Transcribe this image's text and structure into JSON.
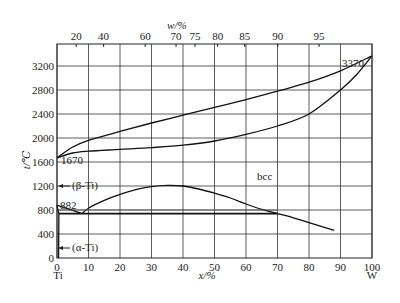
{
  "chart_data": {
    "type": "line",
    "xlabel": "x/%",
    "x2label": "w/%",
    "ylabel": "t/℃",
    "xlim": [
      0,
      100
    ],
    "ylim": [
      0,
      3600
    ],
    "x_ticks": [
      0,
      10,
      20,
      30,
      40,
      50,
      60,
      70,
      80,
      90,
      100
    ],
    "y_ticks": [
      0,
      400,
      800,
      1200,
      1600,
      2000,
      2400,
      2800,
      3200
    ],
    "top_ticks": [
      {
        "label": "20",
        "x": 6.1
      },
      {
        "label": "40",
        "x": 14.8
      },
      {
        "label": "60",
        "x": 28.0
      },
      {
        "label": "70",
        "x": 37.8
      },
      {
        "label": "75",
        "x": 43.8
      },
      {
        "label": "80",
        "x": 51.0
      },
      {
        "label": "85",
        "x": 59.6
      },
      {
        "label": "90",
        "x": 70.1
      },
      {
        "label": "95",
        "x": 83.2
      }
    ],
    "grid": true,
    "endpoint_labels": {
      "left": "Ti",
      "right": "W"
    },
    "annotations": [
      {
        "text": "3370",
        "x": 100,
        "y": 3370
      },
      {
        "text": "1670",
        "x": 0,
        "y": 1670
      },
      {
        "text": "882",
        "x": 0,
        "y": 882
      },
      {
        "text": "(β-Ti)",
        "x": 0,
        "y": 1250
      },
      {
        "text": "(α-Ti)",
        "x": 0,
        "y": 200
      },
      {
        "text": "bcc",
        "x": 58,
        "y": 1450
      }
    ],
    "series": [
      {
        "name": "liquidus",
        "x": [
          0,
          5,
          10,
          20,
          30,
          40,
          50,
          60,
          70,
          80,
          90,
          100
        ],
        "y": [
          1670,
          1850,
          1960,
          2110,
          2250,
          2380,
          2510,
          2640,
          2780,
          2930,
          3120,
          3370
        ]
      },
      {
        "name": "solidus",
        "x": [
          0,
          5,
          10,
          20,
          30,
          40,
          50,
          60,
          70,
          80,
          90,
          95,
          100
        ],
        "y": [
          1670,
          1750,
          1780,
          1810,
          1840,
          1880,
          1950,
          2060,
          2200,
          2400,
          2800,
          3050,
          3370
        ]
      },
      {
        "name": "miscibility gap",
        "x": [
          8,
          10,
          15,
          20,
          25,
          30,
          35,
          40,
          45,
          50,
          55,
          60,
          65,
          70,
          75,
          80,
          88
        ],
        "y": [
          740,
          830,
          960,
          1060,
          1140,
          1190,
          1210,
          1200,
          1150,
          1080,
          1000,
          900,
          810,
          740,
          670,
          590,
          460
        ]
      },
      {
        "name": "beta transus",
        "x": [
          0,
          8
        ],
        "y": [
          882,
          740
        ]
      },
      {
        "name": "eutectoid",
        "x": [
          0.5,
          70
        ],
        "y": [
          740,
          740
        ]
      },
      {
        "name": "alpha solvus",
        "x": [
          0,
          0.3,
          0.6,
          0.5
        ],
        "y": [
          882,
          800,
          740,
          0
        ]
      }
    ]
  },
  "labels": {
    "xlabel": "x/%",
    "x2label": "w/%",
    "ylabel": "t/℃",
    "left_element": "Ti",
    "right_element": "W",
    "melt_w": "3370",
    "melt_ti": "1670",
    "transus": "882",
    "beta_ti": "(β-Ti)",
    "alpha_ti": "(α-Ti)",
    "bcc": "bcc"
  }
}
